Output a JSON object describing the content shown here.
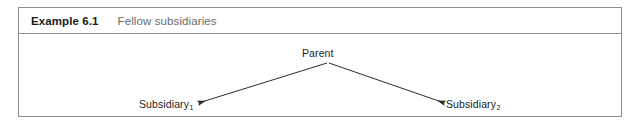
{
  "example": {
    "label": "Example 6.1",
    "title": "Fellow subsidiaries"
  },
  "diagram": {
    "type": "tree",
    "nodes": [
      {
        "id": "parent",
        "label": "Parent",
        "x": 327,
        "y": 48
      },
      {
        "id": "subsidiary-1",
        "label": "Subsidiary",
        "subscript": "1",
        "x": 175,
        "y": 100
      },
      {
        "id": "subsidiary-2",
        "label": "Subsidiary",
        "subscript": "2",
        "x": 482,
        "y": 100
      }
    ],
    "edges": [
      {
        "from": "parent",
        "to": "subsidiary-1",
        "arrowhead": "filled-triangle",
        "direction": "down-left"
      },
      {
        "from": "parent",
        "to": "subsidiary-2",
        "arrowhead": "filled-triangle",
        "direction": "down-right"
      }
    ]
  },
  "colors": {
    "border": "#8d8d8d",
    "label_text": "#1a1a1a",
    "title_text": "#6b6b6b",
    "node_text": "#1c1c1c",
    "line": "#2b2b2b",
    "background": "#ffffff"
  }
}
